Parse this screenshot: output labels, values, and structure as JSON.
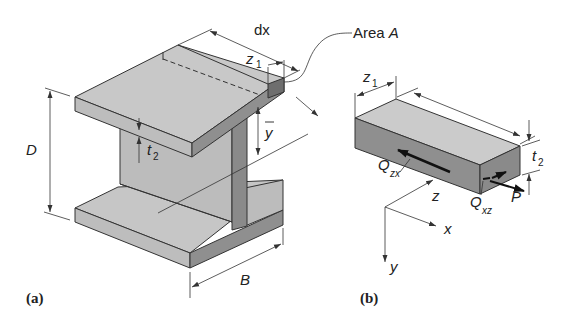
{
  "figure": {
    "panel_a": {
      "caption": "(a)",
      "labels": {
        "dx": "dx",
        "z1_main": "z",
        "z1_sub": "1",
        "area": "Area ",
        "area_var": "A",
        "D": "D",
        "t2_main": "t",
        "t2_sub": "2",
        "ybar": "y",
        "B": "B"
      }
    },
    "panel_b": {
      "caption": "(b)",
      "labels": {
        "z1_main": "z",
        "z1_sub": "1",
        "t2_main": "t",
        "t2_sub": "2",
        "Qzx_main": "Q",
        "Qzx_sub": "zx",
        "Qxz_main": "Q",
        "Qxz_sub": "xz",
        "P": "P"
      },
      "axes": {
        "z": "z",
        "x": "x",
        "y": "y"
      }
    },
    "colors": {
      "face_top": "#c8c8c8",
      "face_front": "#bdbdbd",
      "face_side": "#8f8f8f",
      "face_dark": "#6e6e6e",
      "line": "#333333"
    }
  }
}
